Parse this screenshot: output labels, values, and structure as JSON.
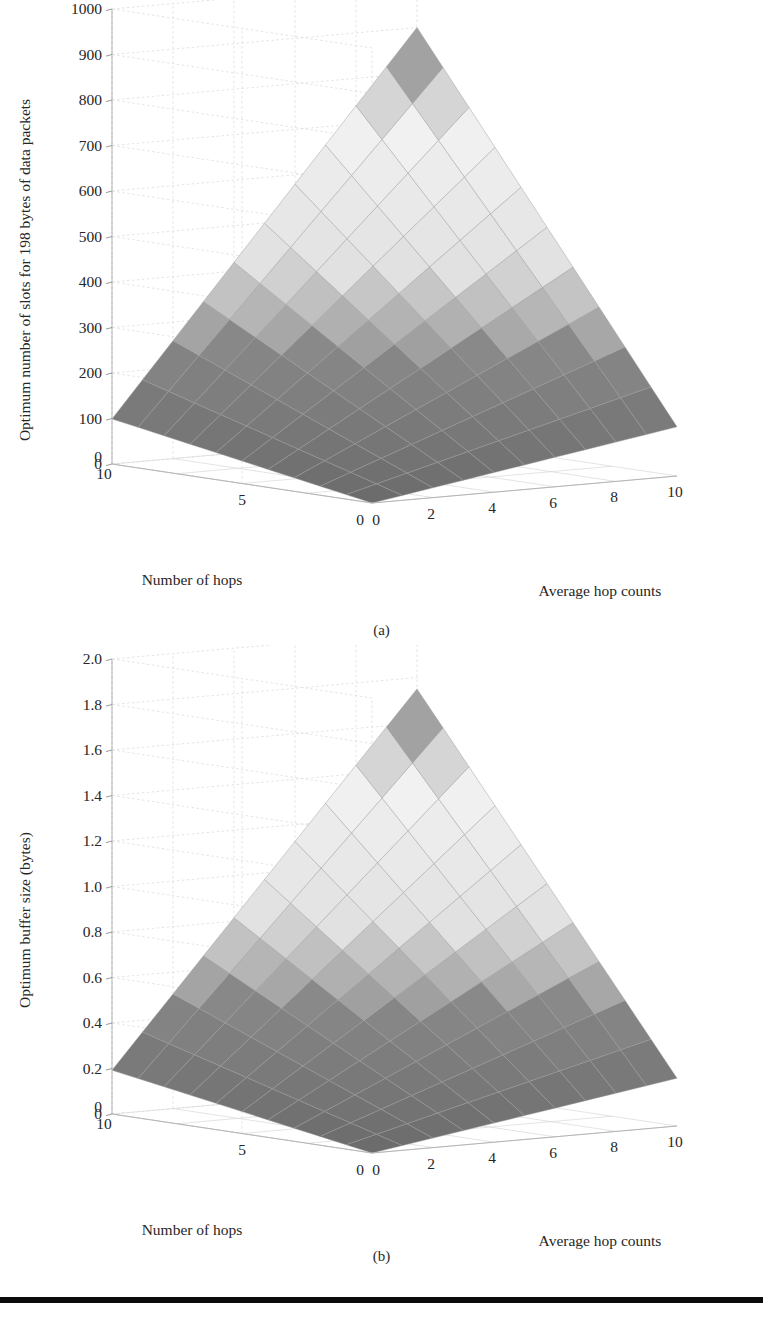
{
  "figure": {
    "background_color": "#ffffff",
    "text_color": "#262626",
    "rule_color": "#0b0b0b"
  },
  "panels": [
    {
      "id": "a",
      "caption": "(a)",
      "chart_data": {
        "type": "surface",
        "title": "",
        "zlabel": "Optimum number of slots for 198 bytes of data packets",
        "xlabel": "Average hop counts",
        "ylabel": "Number of hops",
        "zticks": [
          0,
          100,
          200,
          300,
          400,
          500,
          600,
          700,
          800,
          900,
          1000
        ],
        "ztick_labels": [
          "0",
          "100",
          "200",
          "300",
          "400",
          "500",
          "600",
          "700",
          "800",
          "900",
          "1000"
        ],
        "zlim": [
          0,
          1000
        ],
        "xticks": [
          0,
          2,
          4,
          6,
          8,
          10
        ],
        "xtick_labels": [
          "0",
          "2",
          "4",
          "6",
          "8",
          "10"
        ],
        "xlim": [
          0,
          10
        ],
        "yticks": [
          0,
          5,
          10
        ],
        "ytick_labels": [
          "0",
          "5",
          "10"
        ],
        "ylim": [
          0,
          10
        ],
        "grid": true,
        "legend": "none",
        "multiplier": "",
        "surface_description": "Planar ruled surface increasing with both average hop counts and number of hops; grayscale banded shading from dark (low values) through light (mid) to dark at the high ridge.",
        "corner_values": {
          "x0_y0": 0,
          "x10_y0": 120,
          "x0_y10": 100,
          "x10_y10": 900
        },
        "z_at_corners_note": "z ranges from about 0 at the near origin corner to about 900 at the far (x=10, y=10) corner."
      }
    },
    {
      "id": "b",
      "caption": "(b)",
      "chart_data": {
        "type": "surface",
        "title": "",
        "zlabel": "Optimum buffer size (bytes)",
        "xlabel": "Average hop counts",
        "ylabel": "Number of hops",
        "zticks": [
          0,
          0.2,
          0.4,
          0.6,
          0.8,
          1.0,
          1.2,
          1.4,
          1.6,
          1.8,
          2.0
        ],
        "ztick_labels": [
          "0",
          "0.2",
          "0.4",
          "0.6",
          "0.8",
          "1.0",
          "1.2",
          "1.4",
          "1.6",
          "1.8",
          "2.0"
        ],
        "zlim": [
          0,
          2.0
        ],
        "xticks": [
          0,
          2,
          4,
          6,
          8,
          10
        ],
        "xtick_labels": [
          "0",
          "2",
          "4",
          "6",
          "8",
          "10"
        ],
        "xlim": [
          0,
          10
        ],
        "yticks": [
          0,
          5,
          10
        ],
        "ytick_labels": [
          "0",
          "5",
          "10"
        ],
        "ylim": [
          0,
          10
        ],
        "grid": true,
        "legend": "none",
        "multiplier": "× 10",
        "multiplier_exponent": "5",
        "surface_description": "Planar ruled surface increasing with both average hop counts and number of hops; grayscale banded shading from dark (low values) through light (mid) to dark at the high ridge.",
        "corner_values": {
          "x0_y0": 0,
          "x10_y0": 0.24,
          "x0_y10": 0.2,
          "x10_y10": 1.75
        },
        "z_at_corners_note": "z ranges from about 0 at the near origin corner to about 1.75e5 at the far (x=10, y=10) corner."
      }
    }
  ],
  "colors": {
    "surface_dark": "#6a6a6a",
    "surface_mid": "#a8a8a8",
    "surface_light": "#ededed",
    "surface_lightest": "#f7f7f7",
    "mesh_line": "#9b9b9b",
    "grid_line": "#d8d8d8",
    "axis_line": "#b4b4b4"
  }
}
